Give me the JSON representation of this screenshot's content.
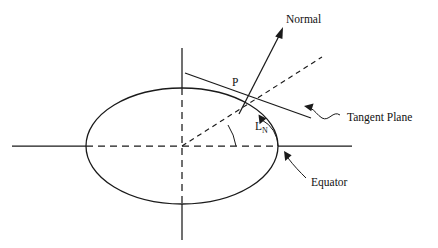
{
  "figure": {
    "background_color": "#ffffff",
    "ink_color": "#1a1a1a",
    "width": 438,
    "height": 248
  },
  "labels": {
    "normal": "Normal",
    "tangent_plane": "Tangent Plane",
    "equator": "Equator",
    "point_p": "P",
    "latitude_symbol": "L",
    "latitude_subscript": "N"
  },
  "geometry": {
    "ellipse": {
      "cx": 182,
      "cy": 146,
      "rx": 96,
      "ry": 58,
      "style": "solid"
    },
    "horizontal_axis": {
      "x1": 12,
      "y1": 146,
      "x2": 352,
      "y2": 146,
      "inside_style": "dashed",
      "outside_style": "solid"
    },
    "vertical_axis": {
      "x1": 182,
      "y1": 48,
      "x2": 182,
      "y2": 240,
      "inside_style": "dashed",
      "outside_style": "solid"
    },
    "point_p": {
      "x": 248,
      "y": 96
    },
    "normal_arrow": {
      "x1": 240,
      "y1": 112,
      "x2": 283,
      "y2": 28,
      "style": "solid-arrow"
    },
    "tangent_line": {
      "x1": 185,
      "y1": 73,
      "x2": 311,
      "y2": 118,
      "style": "solid"
    },
    "geocentric_radius": {
      "x1": 182,
      "y1": 146,
      "x2": 322,
      "y2": 57,
      "style": "dashed"
    },
    "angle_arc_latitude": {
      "center_x": 248,
      "center_y": 146,
      "radius": 30,
      "start_deg": 0,
      "end_deg": 62,
      "has_arrowhead": true
    },
    "angle_arc_geocentric": {
      "center_x": 182,
      "center_y": 146,
      "radius": 56,
      "start_deg": 0,
      "end_deg": 32
    }
  },
  "annotations": [
    {
      "name": "normal-label",
      "text": "Normal",
      "x": 286,
      "y": 20
    },
    {
      "name": "tangent-plane-label",
      "text": "Tangent Plane",
      "x": 344,
      "y": 118,
      "leader": "wavy-arrow-left"
    },
    {
      "name": "equator-label",
      "text": "Equator",
      "x": 308,
      "y": 183,
      "leader": "curved-arrow-upleft"
    },
    {
      "name": "point-p-label",
      "text": "P",
      "x": 233,
      "y": 83
    },
    {
      "name": "latitude-label",
      "text": "L",
      "subscript": "N",
      "x": 256,
      "y": 128
    }
  ]
}
